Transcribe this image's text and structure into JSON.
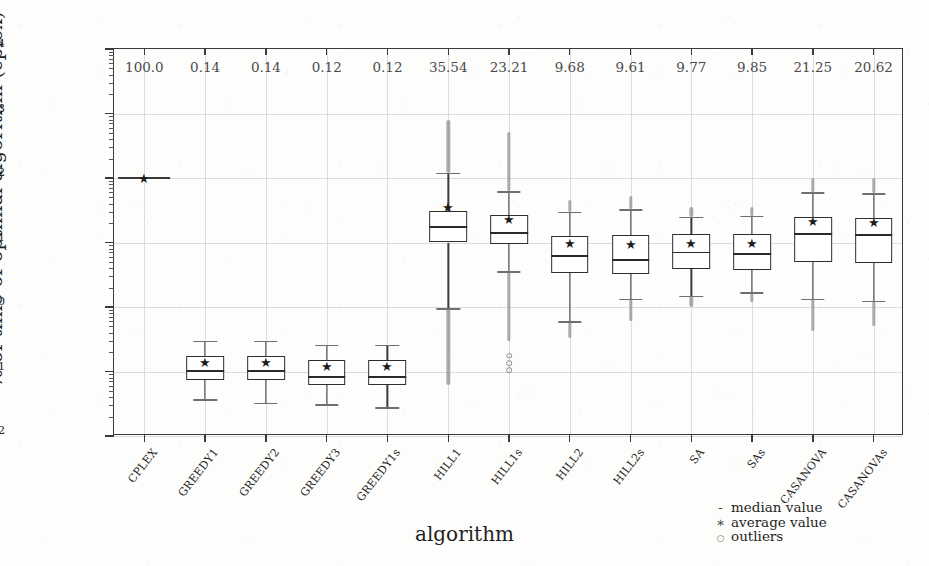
{
  "chart_data": {
    "type": "box",
    "title": "",
    "xlabel": "algorithm",
    "ylabel": "% of time of optimal algorithm (cplex)",
    "yscale": "log",
    "ylim": [
      0.01,
      10000
    ],
    "ytick_labels": [
      "10⁴",
      "10³",
      "10²",
      "10¹",
      "10⁰",
      "10⁻¹",
      "10⁻²"
    ],
    "ytick_mantissa": [
      "10",
      "10",
      "10",
      "10",
      "10",
      "10",
      "10"
    ],
    "ytick_exponent": [
      "4",
      "3",
      "2",
      "1",
      "0",
      "-1",
      "-2"
    ],
    "ytick_values": [
      10000,
      1000,
      100,
      10,
      1,
      0.1,
      0.01
    ],
    "grid": true,
    "grid_axis": "both",
    "annotation_row_label": "average value printed above each box",
    "categories": [
      "CPLEX",
      "GREEDY1",
      "GREEDY2",
      "GREEDY3",
      "GREEDY1s",
      "HILL1",
      "HILL1s",
      "HILL2",
      "HILL2s",
      "SA",
      "SAs",
      "CASANOVA",
      "CASANOVAs"
    ],
    "annotations": [
      "100.0",
      "0.14",
      "0.14",
      "0.12",
      "0.12",
      "35.54",
      "23.21",
      "9.68",
      "9.61",
      "9.77",
      "9.85",
      "21.25",
      "20.62"
    ],
    "boxes": [
      {
        "category": "CPLEX",
        "whisker_low": 100.0,
        "q1": 100.0,
        "median": 100.0,
        "q3": 100.0,
        "whisker_high": 100.0,
        "mean": 100.0,
        "degenerate": true,
        "outlier_low": null,
        "outlier_high": null,
        "outliers": []
      },
      {
        "category": "GREEDY1",
        "whisker_low": 0.037,
        "q1": 0.075,
        "median": 0.105,
        "q3": 0.175,
        "whisker_high": 0.3,
        "mean": 0.14,
        "degenerate": false,
        "outlier_low": null,
        "outlier_high": null,
        "outliers": []
      },
      {
        "category": "GREEDY2",
        "whisker_low": 0.033,
        "q1": 0.073,
        "median": 0.105,
        "q3": 0.175,
        "whisker_high": 0.3,
        "mean": 0.14,
        "degenerate": false,
        "outlier_low": null,
        "outlier_high": null,
        "outliers": []
      },
      {
        "category": "GREEDY3",
        "whisker_low": 0.031,
        "q1": 0.062,
        "median": 0.085,
        "q3": 0.15,
        "whisker_high": 0.26,
        "mean": 0.12,
        "degenerate": false,
        "outlier_low": null,
        "outlier_high": null,
        "outliers": []
      },
      {
        "category": "GREEDY1s",
        "whisker_low": 0.028,
        "q1": 0.061,
        "median": 0.085,
        "q3": 0.15,
        "whisker_high": 0.26,
        "mean": 0.12,
        "degenerate": false,
        "outlier_low": null,
        "outlier_high": null,
        "outliers": []
      },
      {
        "category": "HILL1",
        "whisker_low": 0.95,
        "q1": 10.0,
        "median": 18.0,
        "q3": 31.0,
        "whisker_high": 120.0,
        "mean": 35.54,
        "degenerate": false,
        "outlier_low": 0.062,
        "outlier_high": 790.0,
        "outliers": []
      },
      {
        "category": "HILL1s",
        "whisker_low": 3.6,
        "q1": 9.5,
        "median": 14.5,
        "q3": 27.0,
        "whisker_high": 62.0,
        "mean": 23.21,
        "degenerate": false,
        "outlier_low": 0.3,
        "outlier_high": 520.0,
        "outliers": [
          0.105,
          0.135,
          0.175
        ]
      },
      {
        "category": "HILL2",
        "whisker_low": 0.6,
        "q1": 3.4,
        "median": 6.3,
        "q3": 12.5,
        "whisker_high": 30.0,
        "mean": 9.68,
        "degenerate": false,
        "outlier_low": 0.33,
        "outlier_high": 46.0,
        "outliers": []
      },
      {
        "category": "HILL2s",
        "whisker_low": 1.35,
        "q1": 3.3,
        "median": 5.6,
        "q3": 13.0,
        "whisker_high": 33.0,
        "mean": 9.61,
        "degenerate": false,
        "outlier_low": 0.6,
        "outlier_high": 52.0,
        "outliers": []
      },
      {
        "category": "SA",
        "whisker_low": 1.5,
        "q1": 3.9,
        "median": 7.2,
        "q3": 13.5,
        "whisker_high": 25.0,
        "mean": 9.77,
        "degenerate": false,
        "outlier_low": 1.0,
        "outlier_high": 36.0,
        "outliers": []
      },
      {
        "category": "SAs",
        "whisker_low": 1.7,
        "q1": 3.8,
        "median": 6.8,
        "q3": 13.5,
        "whisker_high": 26.0,
        "mean": 9.85,
        "degenerate": false,
        "outlier_low": 1.2,
        "outlier_high": 36.0,
        "outliers": []
      },
      {
        "category": "CASANOVA",
        "whisker_low": 1.35,
        "q1": 5.0,
        "median": 14.0,
        "q3": 24.5,
        "whisker_high": 60.0,
        "mean": 21.25,
        "degenerate": false,
        "outlier_low": 0.42,
        "outlier_high": 100.0,
        "outliers": []
      },
      {
        "category": "CASANOVAs",
        "whisker_low": 1.25,
        "q1": 4.8,
        "median": 13.5,
        "q3": 24.0,
        "whisker_high": 58.0,
        "mean": 20.62,
        "degenerate": false,
        "outlier_low": 0.5,
        "outlier_high": 100.0,
        "outliers": []
      }
    ],
    "legend": {
      "position": "bottom-right",
      "entries": [
        {
          "glyph": "-",
          "glyph_name": "median-dash-glyph",
          "label": "median value"
        },
        {
          "glyph": "∗",
          "glyph_name": "average-star-glyph",
          "label": "average value"
        },
        {
          "glyph": "○",
          "glyph_name": "outlier-circle-glyph",
          "label": "outliers"
        }
      ]
    },
    "colors": {
      "frame": "#3a3a3a",
      "grid": "#d8dde4",
      "box_outline": "#2e2e2e",
      "box_fill": "#ffffff",
      "whisker": "#3a3a3a",
      "cap": "#6f6f6f",
      "mean_marker": "#1c1c1c",
      "outlier": "#8e8e8e",
      "annotation_text": "#4a4a4a",
      "background": "#fdfdfb"
    }
  }
}
